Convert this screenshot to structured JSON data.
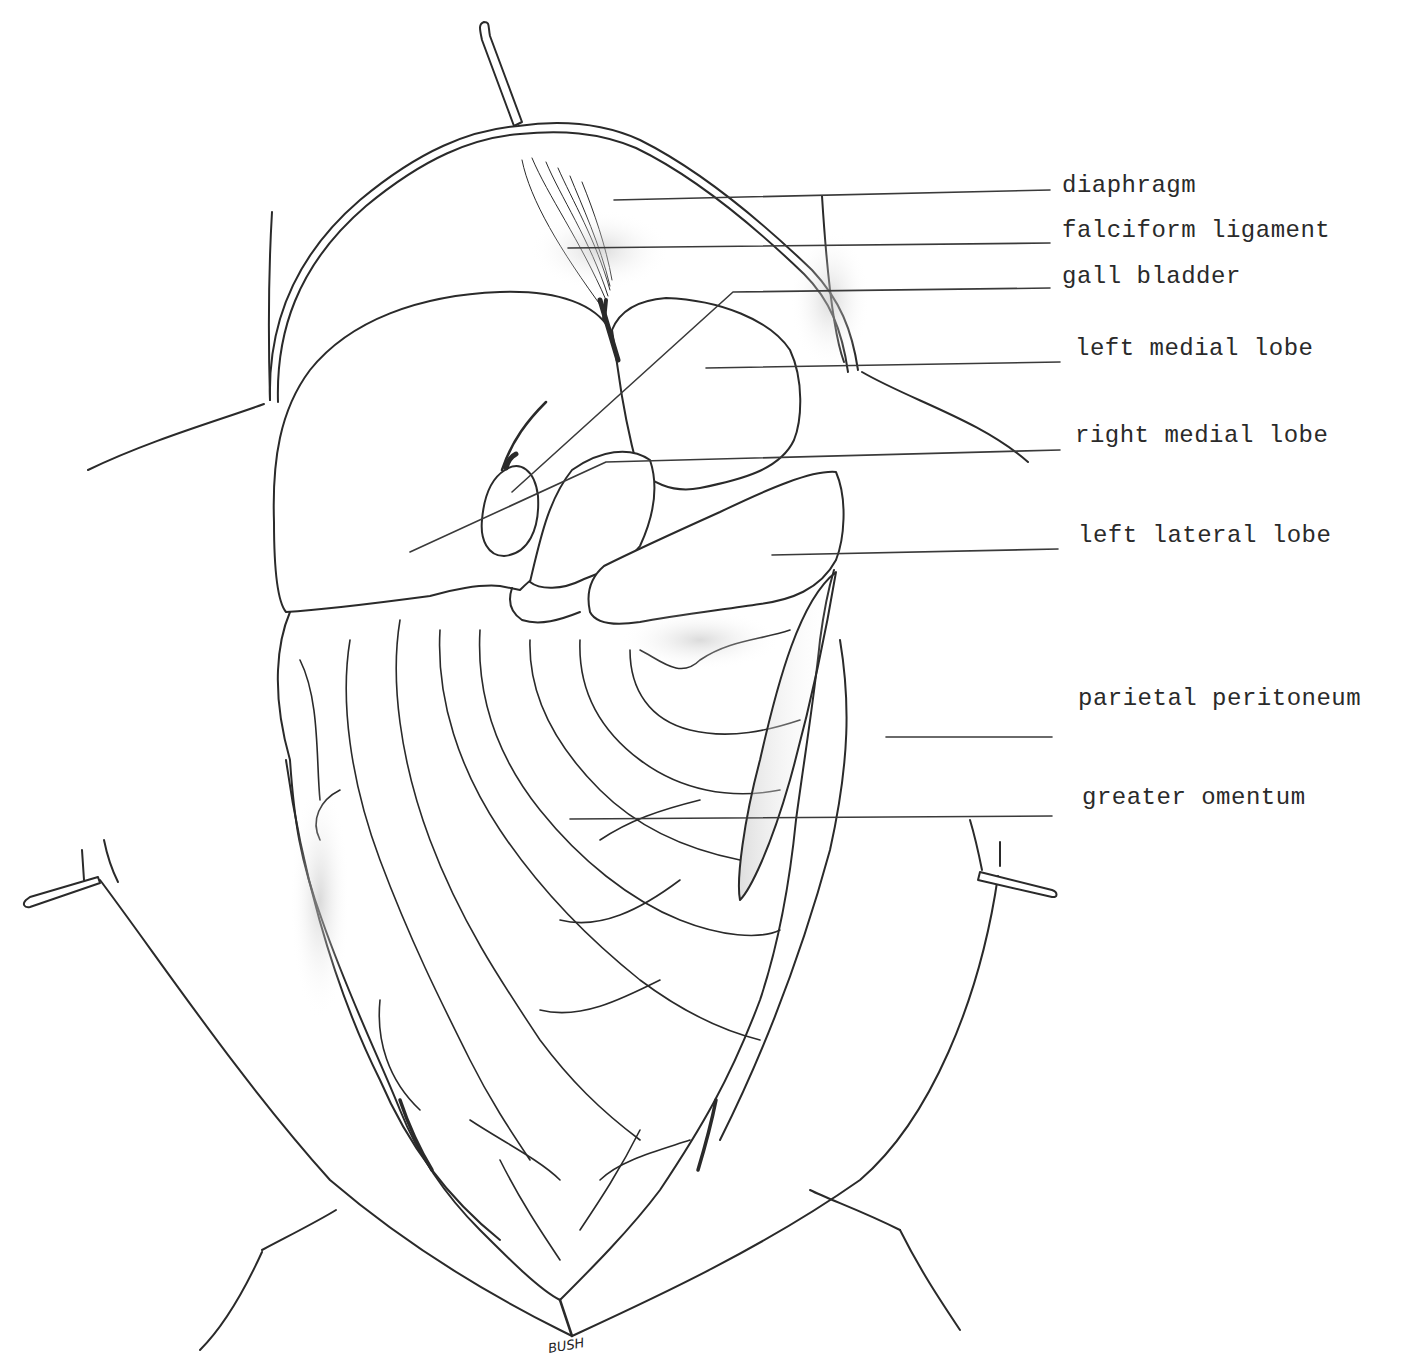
{
  "figure": {
    "type": "anatomical-illustration",
    "signature": "BUSH",
    "line_color": "#2a2a2a",
    "background": "#ffffff"
  },
  "labels": [
    {
      "id": "diaphragm",
      "text": "diaphragm",
      "x": 1062,
      "y": 172,
      "leader": {
        "x1": 614,
        "y1": 200,
        "x2": 1050,
        "y2": 190
      }
    },
    {
      "id": "falciform-ligament",
      "text": "falciform ligament",
      "x": 1062,
      "y": 217,
      "leader": {
        "x1": 568,
        "y1": 248,
        "x2": 1050,
        "y2": 243
      }
    },
    {
      "id": "gall-bladder",
      "text": "gall bladder",
      "x": 1062,
      "y": 263,
      "leader": {
        "x1": 733,
        "y1": 292,
        "x2": 1050,
        "y2": 288,
        "diag_x": 512,
        "diag_y": 492
      }
    },
    {
      "id": "left-medial-lobe",
      "text": "left medial lobe",
      "x": 1075,
      "y": 335,
      "leader": {
        "x1": 706,
        "y1": 368,
        "x2": 1060,
        "y2": 362
      }
    },
    {
      "id": "right-medial-lobe",
      "text": "right medial lobe",
      "x": 1075,
      "y": 422,
      "leader": {
        "x1": 606,
        "y1": 462,
        "x2": 1060,
        "y2": 450,
        "diag_x": 410,
        "diag_y": 552
      }
    },
    {
      "id": "left-lateral-lobe",
      "text": "left lateral lobe",
      "x": 1078,
      "y": 522,
      "leader": {
        "x1": 772,
        "y1": 555,
        "x2": 1058,
        "y2": 549
      }
    },
    {
      "id": "parietal-peritoneum",
      "text": "parietal peritoneum",
      "x": 1078,
      "y": 685,
      "leader": {
        "x1": 886,
        "y1": 737,
        "x2": 1052,
        "y2": 737
      }
    },
    {
      "id": "greater-omentum",
      "text": "greater omentum",
      "x": 1082,
      "y": 784,
      "leader": {
        "x1": 570,
        "y1": 819,
        "x2": 1052,
        "y2": 816
      }
    }
  ]
}
